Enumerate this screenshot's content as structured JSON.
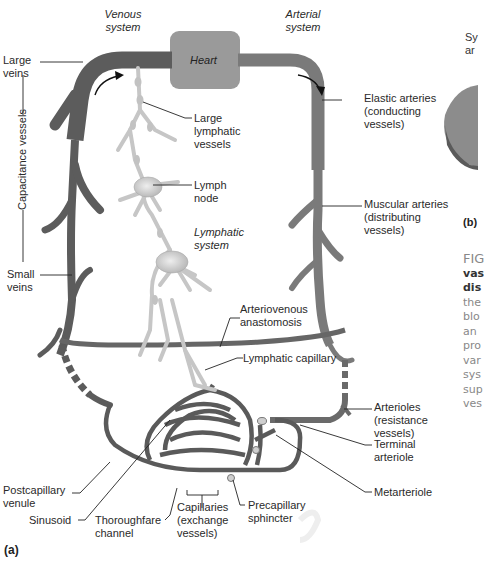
{
  "diagram": {
    "panel_a_label": "(a)",
    "panel_b_label": "(b)",
    "headers": {
      "venous": [
        "Venous",
        "system"
      ],
      "arterial": [
        "Arterial",
        "system"
      ],
      "lymphatic": [
        "Lymphatic",
        "system"
      ]
    },
    "heart": "Heart",
    "capacitance_label": "Capacitance vessels",
    "labels": {
      "large_veins": [
        "Large",
        "veins"
      ],
      "small_veins": [
        "Small",
        "veins"
      ],
      "large_lymphatic_vessels": [
        "Large",
        "lymphatic",
        "vessels"
      ],
      "lymph_node": [
        "Lymph",
        "node"
      ],
      "elastic_arteries": [
        "Elastic arteries",
        "(conducting",
        "vessels)"
      ],
      "muscular_arteries": [
        "Muscular arteries",
        "(distributing",
        "vessels)"
      ],
      "arteriovenous_anastomosis": [
        "Arteriovenous",
        "anastomosis"
      ],
      "lymphatic_capillary": "Lymphatic capillary",
      "arterioles": [
        "Arterioles",
        "(resistance",
        "vessels)"
      ],
      "terminal_arteriole": [
        "Terminal",
        "arteriole"
      ],
      "metarteriole": "Metarteriole",
      "postcapillary_venule": [
        "Postcapillary",
        "venule"
      ],
      "sinusoid": "Sinusoid",
      "thoroughfare_channel": [
        "Thoroughfare",
        "channel"
      ],
      "capillaries": [
        "Capillaries",
        "(exchange",
        "vessels)"
      ],
      "precapillary_sphincter": [
        "Precapillary",
        "sphincter"
      ]
    },
    "panel_b_partial": [
      "Sy",
      "ar"
    ],
    "caption_partial": [
      "FIG",
      "vas",
      "dis",
      "the",
      "blo",
      "an",
      "pro",
      "var",
      "sys",
      "sup",
      "ves"
    ],
    "colors": {
      "vessel": "#6b6b6b",
      "vessel_dark": "#4e4e4e",
      "lymph": "#c8c8c8",
      "heart": "#9a9a9a"
    }
  }
}
